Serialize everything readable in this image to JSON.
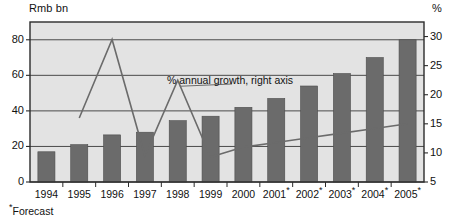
{
  "chart_data": {
    "type": "bar",
    "title": "",
    "xlabel": "",
    "ylabel": "Rmb bn",
    "y2label": "%",
    "grid": true,
    "legend_position": "inline-annotation",
    "categories": [
      "1994",
      "1995",
      "1996",
      "1997",
      "1998",
      "1999",
      "2000",
      "2001*",
      "2002*",
      "2003*",
      "2004*",
      "2005*"
    ],
    "ylim": [
      0,
      90
    ],
    "y2lim": [
      5,
      32.5
    ],
    "yticks": [
      0,
      20,
      40,
      60,
      80
    ],
    "y2ticks": [
      5,
      10,
      15,
      20,
      25,
      30
    ],
    "series": [
      {
        "name": "Rmb bn",
        "type": "bar",
        "axis": "left",
        "color": "#6b6b6b",
        "values": [
          17,
          21,
          26.5,
          28,
          34.5,
          37,
          42,
          47,
          54,
          61,
          70,
          80
        ]
      },
      {
        "name": "% annual growth, right axis",
        "type": "line",
        "axis": "right",
        "color": "#6b6b6b",
        "x": [
          "1995",
          "1996",
          "1997",
          "1998",
          "1999",
          "2000",
          "2001*",
          "2002*",
          "2003*",
          "2004*",
          "2005*"
        ],
        "values": [
          16.0,
          29.5,
          9.5,
          22.5,
          9.3,
          11.0,
          11.8,
          12.6,
          13.4,
          14.2,
          15.0
        ]
      }
    ],
    "annotations": [
      {
        "text": "% annual growth, right axis",
        "target": "growth-line"
      }
    ],
    "footnote": "Forecast",
    "footnote_marker": "*"
  },
  "axes": {
    "left_unit": "Rmb bn",
    "right_unit": "%",
    "left_ticks": [
      "80",
      "60",
      "40",
      "20",
      "0"
    ],
    "right_ticks": [
      "30",
      "25",
      "20",
      "15",
      "10",
      "5"
    ]
  },
  "xaxis": {
    "years": [
      {
        "label": "1994",
        "marker": ""
      },
      {
        "label": "1995",
        "marker": ""
      },
      {
        "label": "1996",
        "marker": ""
      },
      {
        "label": "1997",
        "marker": ""
      },
      {
        "label": "1998",
        "marker": ""
      },
      {
        "label": "1999",
        "marker": ""
      },
      {
        "label": "2000",
        "marker": ""
      },
      {
        "label": "2001",
        "marker": "*"
      },
      {
        "label": "2002",
        "marker": "*"
      },
      {
        "label": "2003",
        "marker": "*"
      },
      {
        "label": "2004",
        "marker": "*"
      },
      {
        "label": "2005",
        "marker": "*"
      }
    ]
  },
  "annotation": {
    "growth_label": "% annual growth, right axis"
  },
  "footnote": {
    "marker": "*",
    "text": "Forecast"
  },
  "colors": {
    "bar": "#6b6b6b",
    "line": "#6b6b6b",
    "plot_background": "#e3e3e3",
    "grid": "#4a4a4a",
    "frame": "#2b2b2b",
    "text": "#111111"
  }
}
